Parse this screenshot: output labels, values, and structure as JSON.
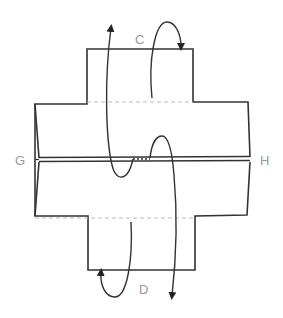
{
  "diagram": {
    "labels": {
      "top": "C",
      "left": "G",
      "right": "H",
      "bottom": "D"
    },
    "colors": {
      "outline": "#333333",
      "fold_line": "#bbbbbb",
      "label": "#9a9a9a",
      "background": "#ffffff"
    },
    "arrows": [
      {
        "name": "long-up-arrow",
        "direction": "up",
        "from": "center",
        "to": "top"
      },
      {
        "name": "top-fold-loop-arrow",
        "direction": "over-and-down",
        "near": "C"
      },
      {
        "name": "bottom-fold-loop-arrow",
        "direction": "under-and-up",
        "near": "D"
      },
      {
        "name": "long-down-arrow",
        "direction": "down",
        "from": "center",
        "to": "bottom"
      }
    ]
  }
}
